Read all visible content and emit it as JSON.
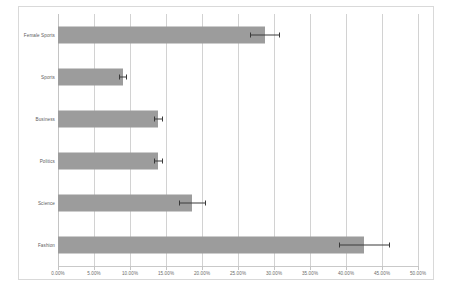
{
  "chart_data": {
    "type": "bar",
    "orientation": "horizontal",
    "title": "",
    "subtitle": "",
    "xlabel": "",
    "ylabel": "",
    "categories": [
      "Female Sports",
      "Sports",
      "Business",
      "Politics",
      "Science",
      "Fashion"
    ],
    "values": [
      28.7,
      9.0,
      13.9,
      13.9,
      18.6,
      42.5
    ],
    "errors": [
      2.0,
      0.5,
      0.6,
      0.5,
      1.8,
      3.5
    ],
    "series": [
      {
        "name": "Percentage",
        "values": [
          28.7,
          9.0,
          13.9,
          13.9,
          18.6,
          42.5
        ],
        "errors": [
          2.0,
          0.5,
          0.6,
          0.5,
          1.8,
          3.5
        ]
      }
    ],
    "xlim": [
      0,
      50
    ],
    "xtick_values": [
      0,
      5,
      10,
      15,
      20,
      25,
      30,
      35,
      40,
      45,
      50
    ],
    "xtick_labels": [
      "0.00%",
      "5.00%",
      "10.00%",
      "15.00%",
      "20.00%",
      "25.00%",
      "30.00%",
      "35.00%",
      "40.00%",
      "45.00%",
      "50.00%"
    ],
    "grid": "vertical",
    "legend": "none",
    "bar_color": "#9c9c9c",
    "gridline_color": "#d2d2d2",
    "errorbar_color": "#3a3a3a",
    "background_color": "#ffffff",
    "frame_color": "#d9d9d9",
    "annotations": []
  }
}
